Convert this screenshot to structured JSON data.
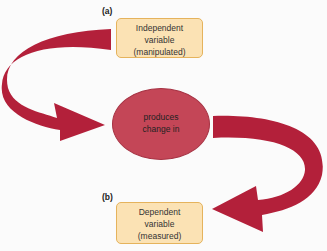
{
  "diagram": {
    "top": {
      "marker": "(a)",
      "lines": [
        "Independent",
        "variable",
        "(manipulated)"
      ]
    },
    "center": {
      "lines": [
        "produces",
        "change in"
      ]
    },
    "bottom": {
      "marker": "(b)",
      "lines": [
        "Dependent",
        "variable",
        "(measured)"
      ]
    },
    "colors": {
      "arrow": "#b3203a",
      "circle": "#c44657",
      "box_fill": "#fbe2b4",
      "box_border": "#e5b35c"
    }
  }
}
